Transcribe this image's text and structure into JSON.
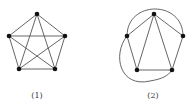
{
  "figures": [
    {
      "id": "graph-1",
      "label": "(1)",
      "description": "Complete graph K5 drawn as a pentagon with all diagonals",
      "vertices": [
        {
          "name": "top",
          "x": 37,
          "y": 14
        },
        {
          "name": "left",
          "x": 9,
          "y": 36
        },
        {
          "name": "right",
          "x": 65,
          "y": 36
        },
        {
          "name": "bottom-left",
          "x": 19,
          "y": 69
        },
        {
          "name": "bottom-right",
          "x": 55,
          "y": 69
        }
      ],
      "edges": [
        [
          0,
          1
        ],
        [
          0,
          2
        ],
        [
          0,
          3
        ],
        [
          0,
          4
        ],
        [
          1,
          2
        ],
        [
          1,
          3
        ],
        [
          1,
          4
        ],
        [
          2,
          3
        ],
        [
          2,
          4
        ],
        [
          3,
          4
        ]
      ]
    },
    {
      "id": "graph-2",
      "label": "(2)",
      "description": "Planar embedding of K5 with two edges redrawn as outer arcs",
      "vertices": [
        {
          "name": "top",
          "x": 154,
          "y": 14
        },
        {
          "name": "left",
          "x": 127,
          "y": 36
        },
        {
          "name": "right",
          "x": 183,
          "y": 36
        },
        {
          "name": "bottom-left",
          "x": 137,
          "y": 70
        },
        {
          "name": "bottom-right",
          "x": 172,
          "y": 70
        }
      ],
      "edges": [
        [
          0,
          1
        ],
        [
          0,
          2
        ],
        [
          0,
          3
        ],
        [
          0,
          4
        ],
        [
          1,
          3
        ],
        [
          2,
          4
        ],
        [
          3,
          4
        ]
      ],
      "curved_edges": [
        [
          1,
          2
        ],
        [
          1,
          4
        ]
      ]
    }
  ]
}
